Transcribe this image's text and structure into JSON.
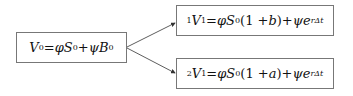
{
  "nodes": {
    "root": {
      "label": "V0 = φS0 + ψB0"
    },
    "up": {
      "label": "1V1 = φS0(1 + b) + ψe^{rΔt}"
    },
    "down": {
      "label": "2V1 = φS0(1 + a) + ψe^{rΔt}"
    }
  },
  "edges": [
    {
      "from": "root",
      "to": "up"
    },
    {
      "from": "root",
      "to": "down"
    }
  ],
  "parts": {
    "V": "V",
    "zero": "0",
    "one": "1",
    "two": "2",
    "eq": " = ",
    "phi": "φ",
    "S": "S",
    "psi": "ψ",
    "B": "B",
    "plus": " + ",
    "open": "(1 + ",
    "b": "b",
    "a": "a",
    "close": ")",
    "e": "e",
    "exp": "rΔt"
  }
}
